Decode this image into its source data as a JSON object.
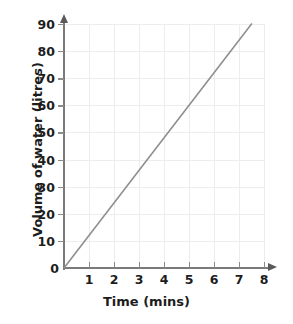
{
  "chart_data": {
    "type": "line",
    "title": "",
    "xlabel": "Time (mins)",
    "ylabel": "Volume of water (litres)",
    "xlim": [
      0,
      8
    ],
    "ylim": [
      0,
      90
    ],
    "grid": true,
    "legend": "none",
    "x_ticks": [
      "1",
      "2",
      "3",
      "4",
      "5",
      "6",
      "7",
      "8"
    ],
    "x_tick_values": [
      1,
      2,
      3,
      4,
      5,
      6,
      7,
      8
    ],
    "y_ticks": [
      "10",
      "20",
      "30",
      "40",
      "50",
      "60",
      "70",
      "80",
      "90"
    ],
    "y_tick_values": [
      10,
      20,
      30,
      40,
      50,
      60,
      70,
      80,
      90
    ],
    "origin_label": "0",
    "series": [
      {
        "name": "Volume of water",
        "color": "#8f8f8f",
        "x": [
          0,
          7.5
        ],
        "y": [
          0,
          90
        ],
        "points": [
          [
            0,
            0
          ],
          [
            1,
            12
          ],
          [
            2,
            24
          ],
          [
            3,
            36
          ],
          [
            4,
            48
          ],
          [
            5,
            60
          ],
          [
            6,
            72
          ],
          [
            7,
            84
          ],
          [
            7.5,
            90
          ]
        ],
        "slope_litres_per_min": 12
      }
    ]
  },
  "axis_colors": {
    "axis": "#7a7a7a",
    "gridline": "#ededed",
    "tick": "#8a8a8a",
    "text": "#1d1d1d",
    "background": "#ffffff"
  }
}
